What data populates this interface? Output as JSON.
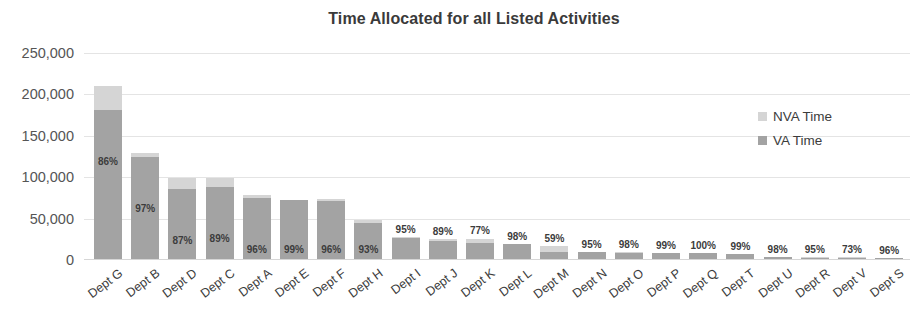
{
  "chart_data": {
    "type": "bar",
    "title": "Time Allocated for all Listed Activities",
    "xlabel": "",
    "ylabel": "",
    "ylim": [
      0,
      250000
    ],
    "ytick_labels": [
      "250,000",
      "200,000",
      "150,000",
      "100,000",
      "50,000",
      "0"
    ],
    "ytick_values": [
      250000,
      200000,
      150000,
      100000,
      50000,
      0
    ],
    "grid": true,
    "stacked": true,
    "legend_position": "right-inside",
    "categories": [
      "Dept G",
      "Dept B",
      "Dept D",
      "Dept C",
      "Dept A",
      "Dept E",
      "Dept F",
      "Dept H",
      "Dept I",
      "Dept J",
      "Dept K",
      "Dept L",
      "Dept M",
      "Dept N",
      "Dept O",
      "Dept P",
      "Dept Q",
      "Dept T",
      "Dept U",
      "Dept R",
      "Dept V",
      "Dept S"
    ],
    "series": [
      {
        "name": "VA Time",
        "color": "#a3a3a3",
        "values": [
          181000,
          125000,
          86000,
          88000,
          75000,
          72000,
          71000,
          45000,
          26000,
          23000,
          20000,
          19000,
          10000,
          9500,
          9000,
          8500,
          8000,
          7000,
          4000,
          3000,
          2500,
          2000
        ]
      },
      {
        "name": "NVA Time",
        "color": "#d5d5d5",
        "values": [
          29000,
          4000,
          13000,
          11000,
          3000,
          700,
          3000,
          3400,
          1400,
          2800,
          6000,
          400,
          7000,
          500,
          180,
          85,
          0,
          70,
          80,
          160,
          920,
          83
        ]
      }
    ],
    "data_labels": [
      "86%",
      "97%",
      "87%",
      "89%",
      "96%",
      "99%",
      "96%",
      "93%",
      "95%",
      "89%",
      "77%",
      "98%",
      "59%",
      "95%",
      "98%",
      "99%",
      "100%",
      "99%",
      "98%",
      "95%",
      "73%",
      "96%"
    ]
  },
  "legend": {
    "items": [
      {
        "label": "NVA Time",
        "color": "#d5d5d5"
      },
      {
        "label": "VA Time",
        "color": "#a3a3a3"
      }
    ]
  }
}
